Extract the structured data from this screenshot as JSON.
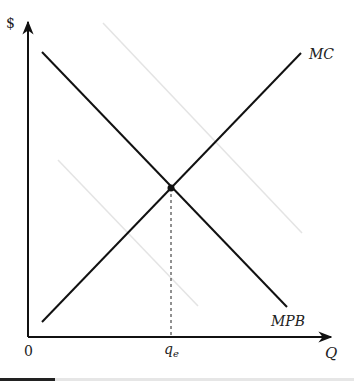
{
  "diagram": {
    "type": "economics-supply-demand",
    "axes": {
      "y_label": "$",
      "x_label": "Q",
      "origin_label": "0"
    },
    "curves": {
      "mc": {
        "label": "MC",
        "from": [
          42,
          322
        ],
        "to": [
          301,
          53
        ]
      },
      "mpb": {
        "label": "MPB",
        "from": [
          42,
          52
        ],
        "to": [
          287,
          307
        ]
      },
      "faint_upper": {
        "from": [
          103,
          23
        ],
        "to": [
          302,
          233
        ]
      },
      "faint_lower": {
        "from": [
          58,
          160
        ],
        "to": [
          198,
          306
        ]
      }
    },
    "equilibrium": {
      "label": "q",
      "label_sub": "e",
      "point": [
        171,
        188
      ]
    },
    "colors": {
      "axis": "#111111",
      "curve": "#111111",
      "faint": "#e2e2e2",
      "dashed": "#222222"
    }
  }
}
